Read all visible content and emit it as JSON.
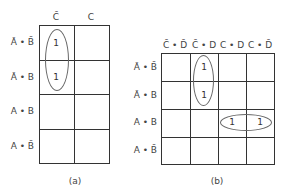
{
  "map_a": {
    "caption": "(a)",
    "columns": [
      "C̄",
      "C"
    ],
    "rows": [
      "Ā • B̄",
      "Ā • B",
      "A • B",
      "A • B̄"
    ],
    "cells": [
      [
        "1",
        ""
      ],
      [
        "1",
        ""
      ],
      [
        "",
        ""
      ],
      [
        "",
        ""
      ]
    ],
    "groups": [
      {
        "description": "vertical loop around column C̄, rows Ā•B̄ and Ā•B"
      }
    ]
  },
  "map_b": {
    "caption": "(b)",
    "columns": [
      "C̄ • D̄",
      "C̄ • D",
      "C • D",
      "C • D̄"
    ],
    "rows": [
      "Ā • B̄",
      "Ā • B",
      "A • B",
      "A • B̄"
    ],
    "cells": [
      [
        "",
        "1",
        "",
        ""
      ],
      [
        "",
        "1",
        "",
        ""
      ],
      [
        "",
        "",
        "1",
        "1"
      ],
      [
        "",
        "",
        "",
        ""
      ]
    ],
    "groups": [
      {
        "description": "vertical loop around column C̄•D, rows Ā•B̄ and Ā•B"
      },
      {
        "description": "horizontal loop around row A•B, columns C•D and C•D̄"
      }
    ]
  }
}
